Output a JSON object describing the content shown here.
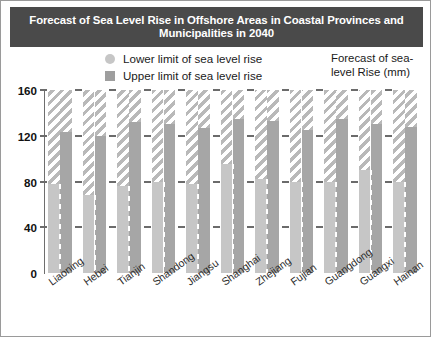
{
  "title": "Forecast of Sea Level Rise in Offshore Areas in Coastal Provinces and Municipalities in 2040",
  "legend": {
    "items": [
      {
        "label": "Lower limit of sea level rise",
        "marker": "circle-swatch-icon",
        "color": "#c6c6c6"
      },
      {
        "label": "Upper limit of sea level rise",
        "marker": "square-swatch-icon",
        "color": "#9e9e9e"
      }
    ]
  },
  "axis_caption": "Forecast of sea-level Rise (mm)",
  "colors": {
    "title_banner": "#4a4a4a",
    "title_text": "#ffffff",
    "lower_bar": "#c6c6c6",
    "upper_bar": "#a6a6a6",
    "hatch": "#b9b9b9",
    "axis": "#6e6e6e",
    "background": "#ffffff"
  },
  "chart_data": {
    "type": "bar",
    "title": "Forecast of Sea Level Rise in Offshore Areas in Coastal Provinces and Municipalities in 2040",
    "xlabel": "",
    "ylabel": "Forecast of sea-level Rise (mm)",
    "ylim": [
      0,
      160
    ],
    "yticks": [
      0,
      40,
      80,
      120,
      160
    ],
    "grid": false,
    "legend_position": "top-center",
    "categories": [
      "Liaoning",
      "Hebei",
      "Tianjin",
      "Shandong",
      "Jiangsu",
      "Shanghai",
      "Zhejiang",
      "Fujian",
      "Guangdong",
      "Guangxi",
      "Hainan"
    ],
    "series": [
      {
        "name": "Lower limit of sea level rise",
        "values": [
          78,
          68,
          76,
          80,
          78,
          95,
          82,
          80,
          80,
          90,
          80
        ]
      },
      {
        "name": "Upper limit of sea level rise",
        "values": [
          123,
          120,
          132,
          130,
          127,
          135,
          133,
          125,
          135,
          130,
          128
        ]
      }
    ]
  }
}
